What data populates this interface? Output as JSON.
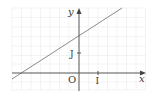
{
  "figure": {
    "type": "coordinate-plane",
    "axes": {
      "x_label": "x",
      "y_label": "y",
      "origin_label": "O",
      "x_unit_label": "I",
      "y_unit_label": "J"
    },
    "grid": true,
    "line": {
      "description": "straight line with positive slope",
      "y_intercept_units": 1.8,
      "x_intercept_units": -3.0
    },
    "colors": {
      "axis": "#555555",
      "line": "#8a8a8a",
      "grid": "#e8e8e8",
      "text": "#3a3a3a"
    }
  }
}
